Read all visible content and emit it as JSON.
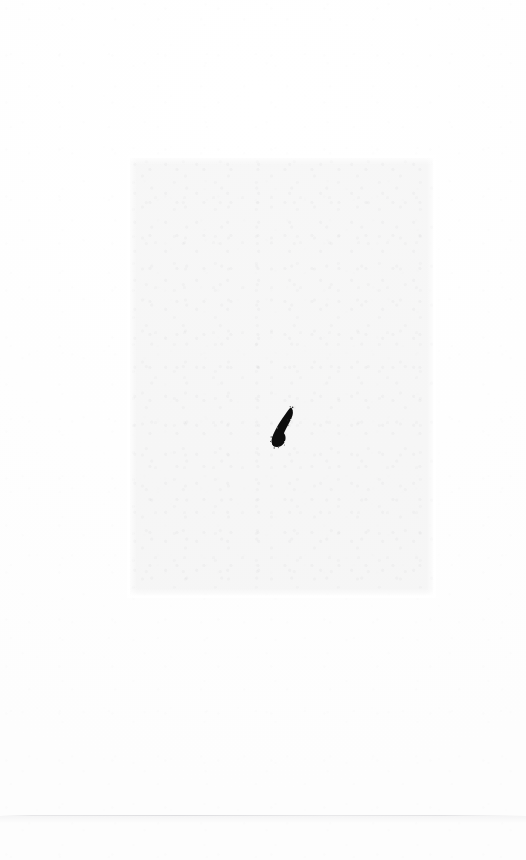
{
  "document": {
    "kind": "scanned-page",
    "width_px": 526,
    "height_px": 860,
    "background_color": "#ffffff",
    "caption": "",
    "visible_text": ""
  },
  "paper": {
    "base_color": "#ffffff",
    "tone_color": "#fdfdfd",
    "grain_color": "#f7f7f8"
  },
  "print_region": {
    "name": "faint-scanned-panel",
    "fill_color": "#e4e4e6",
    "opacity": 0.3,
    "x": 130,
    "y": 158,
    "width": 303,
    "height": 437
  },
  "ink_mark": {
    "name": "ink-blob",
    "shape": "teardrop-comma",
    "color": "#0a0a0a",
    "x": 272,
    "y": 408,
    "width": 24,
    "height": 40,
    "orientation": "tail-up-right"
  },
  "crease": {
    "name": "paper-crease-line",
    "color": "#96969e",
    "y": 815,
    "width": 526,
    "height": 1
  }
}
